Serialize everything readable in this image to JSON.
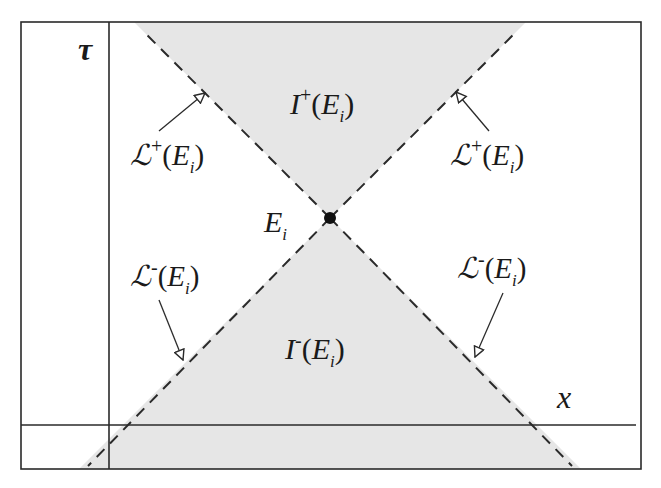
{
  "figure": {
    "type": "spacetime light-cone diagram",
    "colors": {
      "background": "#ffffff",
      "cone_fill": "#e6e6e6",
      "line": "#2a2a2a",
      "text": "#1a1a1a"
    },
    "axes": {
      "vertical_label": "τ",
      "horizontal_label": "x"
    },
    "event": {
      "label_main": "E",
      "label_sub": "i"
    },
    "regions": {
      "future": {
        "main": "I",
        "sup": "+",
        "open": "(",
        "E": "E",
        "sub": "i",
        "close": ")"
      },
      "past": {
        "main": "I",
        "sup": "-",
        "open": "(",
        "E": "E",
        "sub": "i",
        "close": ")"
      }
    },
    "boundaries": {
      "future_left": {
        "main": "ℒ",
        "sup": "+",
        "open": "(",
        "E": "E",
        "sub": "i",
        "close": ")"
      },
      "future_right": {
        "main": "ℒ",
        "sup": "+",
        "open": "(",
        "E": "E",
        "sub": "i",
        "close": ")"
      },
      "past_left": {
        "main": "ℒ",
        "sup": "-",
        "open": "(",
        "E": "E",
        "sub": "i",
        "close": ")"
      },
      "past_right": {
        "main": "ℒ",
        "sup": "-",
        "open": "(",
        "E": "E",
        "sub": "i",
        "close": ")"
      }
    }
  }
}
